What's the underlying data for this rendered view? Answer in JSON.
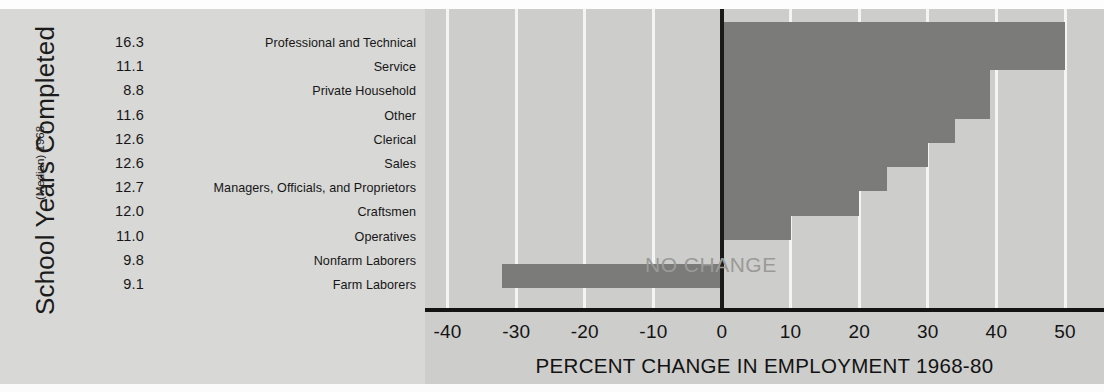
{
  "chart_data": {
    "type": "bar",
    "orientation": "horizontal",
    "title": "",
    "xlabel": "PERCENT CHANGE IN EMPLOYMENT 1968-80",
    "ylabel": "School Years Completed",
    "ylabel_sub": "(Median) 1968",
    "xlim": [
      -45,
      53
    ],
    "xticks": [
      -40,
      -30,
      -20,
      -10,
      0,
      10,
      20,
      30,
      40,
      50
    ],
    "xtick_labels": [
      "-40",
      "-30",
      "-20",
      "-10",
      "0",
      "10",
      "20",
      "30",
      "40",
      "50"
    ],
    "gridlines": [
      -40,
      -30,
      -20,
      -10,
      10,
      20,
      30,
      40,
      50
    ],
    "grid": true,
    "legend": "none",
    "annotations": [
      {
        "text": "NO CHANGE",
        "x": 0,
        "row": 9
      }
    ],
    "zero_reference_label": "NO CHANGE",
    "categories": [
      "Professional and Technical",
      "Service",
      "Private Household",
      "Other",
      "Clerical",
      "Sales",
      "Managers, Officials, and Proprietors",
      "Craftsmen",
      "Operatives",
      "Nonfarm Laborers",
      "Farm Laborers"
    ],
    "values": [
      50,
      50,
      39,
      39,
      34,
      30,
      24,
      20,
      10,
      0,
      -32
    ],
    "median_school_years": [
      16.3,
      11.1,
      8.8,
      11.6,
      12.6,
      12.6,
      12.7,
      12.0,
      11.0,
      9.8,
      9.1
    ],
    "median_school_years_labels": [
      "16.3",
      "11.1",
      "8.8",
      "11.6",
      "12.6",
      "12.6",
      "12.7",
      "12.0",
      "11.0",
      "9.8",
      "9.1"
    ],
    "colors": {
      "bar": "#7b7b79",
      "plot_background": "#cdcdcb",
      "legend_background": "#d8d8d6",
      "gridline": "#f4f4f2",
      "axis": "#131313",
      "annotation_text": "#9a9a98",
      "text": "#161616"
    }
  },
  "rows": [
    {
      "median": "16.3",
      "occupation": "Professional and Technical",
      "value": 50
    },
    {
      "median": "11.1",
      "occupation": "Service",
      "value": 50
    },
    {
      "median": "8.8",
      "occupation": "Private Household",
      "value": 39
    },
    {
      "median": "11.6",
      "occupation": "Other",
      "value": 39
    },
    {
      "median": "12.6",
      "occupation": "Clerical",
      "value": 34
    },
    {
      "median": "12.6",
      "occupation": "Sales",
      "value": 30
    },
    {
      "median": "12.7",
      "occupation": "Managers, Officials, and Proprietors",
      "value": 24
    },
    {
      "median": "12.0",
      "occupation": "Craftsmen",
      "value": 20
    },
    {
      "median": "11.0",
      "occupation": "Operatives",
      "value": 10
    },
    {
      "median": "9.8",
      "occupation": "Nonfarm Laborers",
      "value": 0
    },
    {
      "median": "9.1",
      "occupation": "Farm Laborers",
      "value": -32
    }
  ],
  "left_panel": {
    "title": "School Years Completed",
    "subtitle": "(Median) 1968"
  },
  "plot": {
    "annotation_no_change": "NO CHANGE",
    "xaxis_title": "PERCENT CHANGE IN EMPLOYMENT 1968-80"
  },
  "top_strip": {
    "clipped_text": ""
  }
}
